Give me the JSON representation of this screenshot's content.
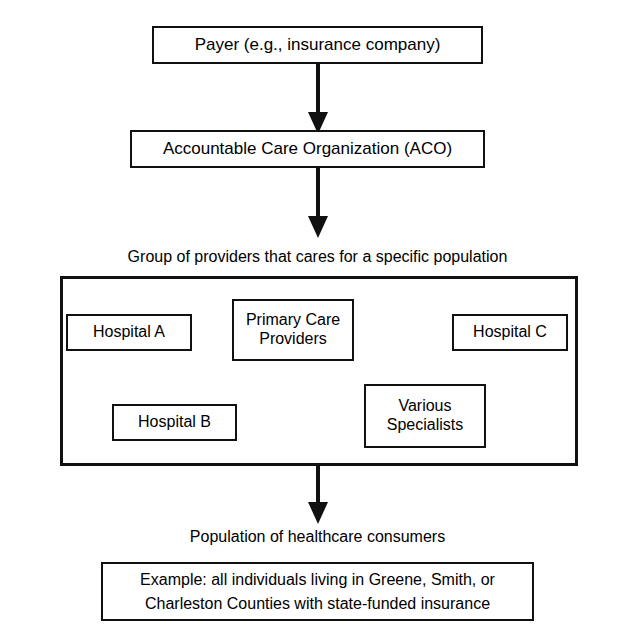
{
  "diagram": {
    "colors": {
      "background": "#ffffff",
      "stroke": "#111111",
      "text": "#000000"
    },
    "nodes": {
      "payer": {
        "label": "Payer (e.g., insurance company)",
        "shape": "rectangle"
      },
      "aco": {
        "label": "Accountable Care Organization (ACO)",
        "shape": "rectangle"
      },
      "group_caption": "Group of providers that cares for a specific population",
      "providers": [
        {
          "id": "hospital-a",
          "label": "Hospital A"
        },
        {
          "id": "primary-care",
          "label": "Primary Care\nProviders"
        },
        {
          "id": "hospital-c",
          "label": "Hospital C"
        },
        {
          "id": "hospital-b",
          "label": "Hospital B"
        },
        {
          "id": "various-specialists",
          "label": "Various\nSpecialists"
        }
      ],
      "population_caption": "Population of healthcare consumers",
      "example": {
        "label": "Example: all individuals living in Greene, Smith, or Charleston Counties with state-funded insurance"
      }
    },
    "arrows": [
      {
        "id": "payer-to-aco",
        "from": "payer",
        "to": "aco",
        "direction": "down"
      },
      {
        "id": "aco-to-group",
        "from": "aco",
        "to": "provider-group",
        "direction": "down"
      },
      {
        "id": "group-to-population",
        "from": "provider-group",
        "to": "example",
        "direction": "down"
      }
    ]
  }
}
